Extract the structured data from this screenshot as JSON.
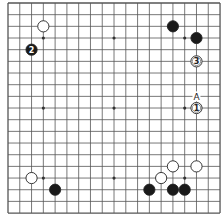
{
  "diagram": {
    "type": "go-board",
    "size": 19,
    "origin": {
      "x": 8,
      "y": 3
    },
    "spacing": {
      "x": 11.78,
      "y": 11.67
    },
    "line_color": "#555555",
    "star_points": [
      [
        3,
        3
      ],
      [
        3,
        9
      ],
      [
        3,
        15
      ],
      [
        9,
        3
      ],
      [
        9,
        9
      ],
      [
        9,
        15
      ],
      [
        15,
        3
      ],
      [
        15,
        9
      ],
      [
        15,
        15
      ]
    ],
    "stones": [
      {
        "color": "white",
        "col": 3,
        "row": 2,
        "label": ""
      },
      {
        "color": "black",
        "col": 2,
        "row": 4,
        "label": "2"
      },
      {
        "color": "black",
        "col": 14,
        "row": 2,
        "label": ""
      },
      {
        "color": "black",
        "col": 16,
        "row": 3,
        "label": ""
      },
      {
        "color": "white",
        "col": 16,
        "row": 5,
        "label": "3"
      },
      {
        "color": "white",
        "col": 16,
        "row": 9,
        "label": "1"
      },
      {
        "color": "white",
        "col": 14,
        "row": 14,
        "label": ""
      },
      {
        "color": "white",
        "col": 16,
        "row": 14,
        "label": ""
      },
      {
        "color": "white",
        "col": 13,
        "row": 15,
        "label": ""
      },
      {
        "color": "black",
        "col": 12,
        "row": 16,
        "label": ""
      },
      {
        "color": "black",
        "col": 14,
        "row": 16,
        "label": ""
      },
      {
        "color": "black",
        "col": 15,
        "row": 16,
        "label": ""
      },
      {
        "color": "white",
        "col": 2,
        "row": 15,
        "label": ""
      },
      {
        "color": "black",
        "col": 4,
        "row": 16,
        "label": ""
      }
    ],
    "markers": [
      {
        "text": "A",
        "col": 16,
        "row": 8
      }
    ]
  }
}
